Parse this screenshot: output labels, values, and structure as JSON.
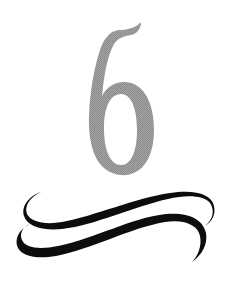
{
  "chapter_ornament": {
    "number": "6",
    "number_color": "#9a9a9a",
    "flourish_color": "#0d0d0d",
    "background": "#ffffff",
    "flourish_icon": "double-swash-flourish-icon"
  }
}
